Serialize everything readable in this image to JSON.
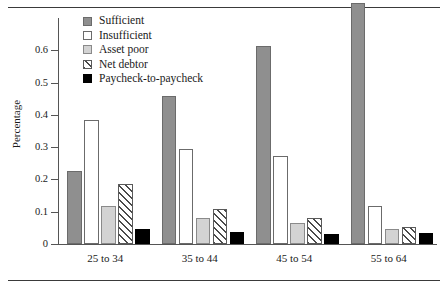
{
  "chart_data": {
    "type": "bar",
    "title": "",
    "xlabel": "",
    "ylabel": "Percentage",
    "ylim": [
      0,
      0.7
    ],
    "yticks": [
      "0",
      "0.1",
      "0.2",
      "0.3",
      "0.4",
      "0.5",
      "0.6"
    ],
    "ytick_values": [
      0,
      0.1,
      0.2,
      0.3,
      0.4,
      0.5,
      0.6
    ],
    "grid": false,
    "legend_position": "top-left-inside",
    "categories": [
      "25 to 34",
      "35 to 44",
      "45 to 54",
      "55 to 64"
    ],
    "series": [
      {
        "name": "Sufficient",
        "color": "#8f8f8f",
        "fill": "solid-gray",
        "values": [
          0.225,
          0.457,
          0.614,
          0.746
        ]
      },
      {
        "name": "Insufficient",
        "color": "#ffffff",
        "fill": "open-white",
        "values": [
          0.385,
          0.293,
          0.272,
          0.118
        ]
      },
      {
        "name": "Asset poor",
        "color": "#d3d3d3",
        "fill": "light-gray",
        "values": [
          0.118,
          0.082,
          0.066,
          0.048
        ]
      },
      {
        "name": "Net debtor",
        "color": "#ffffff",
        "fill": "diagonal-hatch",
        "values": [
          0.186,
          0.11,
          0.08,
          0.054
        ]
      },
      {
        "name": "Paycheck-to-paycheck",
        "color": "#000000",
        "fill": "solid-black",
        "values": [
          0.046,
          0.036,
          0.032,
          0.035
        ]
      }
    ]
  },
  "legend": {
    "items": [
      {
        "label": "Sufficient"
      },
      {
        "label": "Insufficient"
      },
      {
        "label": "Asset poor"
      },
      {
        "label": "Net debtor"
      },
      {
        "label": "Paycheck-to-paycheck"
      }
    ]
  }
}
